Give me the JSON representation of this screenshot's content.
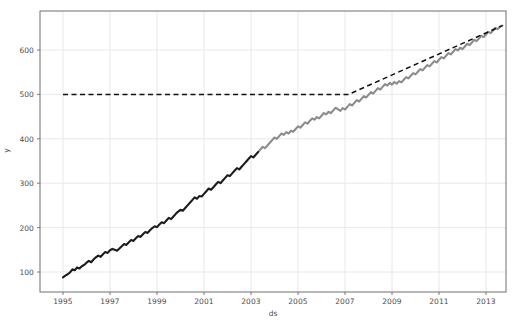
{
  "figure": {
    "title": "",
    "background_color": "#ffffff",
    "axes_background_color": "#ffffff",
    "spine_color": "#6e6e6e",
    "grid_color": "#e8e8ee",
    "plot_box": {
      "left": 40,
      "top": 11,
      "right": 506,
      "bottom": 292
    }
  },
  "axis_labels": {
    "x": "ds",
    "y": "y"
  },
  "y_ticks": [
    {
      "value": 100,
      "label": "100",
      "py": 272.0
    },
    {
      "value": 200,
      "label": "200",
      "py": 227.6
    },
    {
      "value": 300,
      "label": "300",
      "py": 183.2
    },
    {
      "value": 400,
      "label": "400",
      "py": 138.8
    },
    {
      "value": 500,
      "label": "500",
      "py": 94.4
    },
    {
      "value": 600,
      "label": "600",
      "py": 50.0
    }
  ],
  "x_ticks": [
    {
      "value": 1995,
      "label": "1995",
      "px": 63.0
    },
    {
      "value": 1997,
      "label": "1997",
      "px": 112.5
    },
    {
      "value": 1999,
      "label": "1999",
      "px": 162.0
    },
    {
      "value": 2001,
      "label": "2001",
      "px": 211.5
    },
    {
      "value": 2003,
      "label": "2003",
      "px": 261.0
    },
    {
      "value": 2005,
      "label": "2005",
      "px": 310.5
    },
    {
      "value": 2009,
      "label": "2009",
      "px": 409.5
    },
    {
      "value": 2007,
      "label": "2007",
      "px": 360.0
    },
    {
      "value": 2011,
      "label": "2011",
      "px": 459.0
    },
    {
      "value": 2013,
      "label": "2013",
      "px": 486.0
    }
  ],
  "colors": {
    "series_early": "#1c1c1c",
    "series_late": "#8c8c8c",
    "trend": "#111111",
    "grid": "#e8e8ee",
    "spine": "#6e6e6e"
  },
  "chart_data": {
    "type": "line",
    "title": "",
    "xlabel": "ds",
    "ylabel": "y",
    "xlim": [
      1994.3,
      1994.3
    ],
    "ylim": [
      60,
      690
    ],
    "grid": true,
    "legend": "none",
    "x_tick_labels": [
      "1995",
      "1997",
      "1999",
      "2001",
      "2003",
      "2005",
      "2007",
      "2009",
      "2011",
      "2013"
    ],
    "y_tick_labels": [
      "100",
      "200",
      "300",
      "400",
      "500",
      "600"
    ],
    "x_axis_range": [
      1994.3,
      1994.3
    ],
    "y_axis_range": [
      60,
      690
    ],
    "series": [
      {
        "name": "y",
        "style": "solid-noisy",
        "note": "observed series; darker early (1995-2003), lighter gray later (2003-2013.7)",
        "color_early": "#1c1c1c",
        "color_late": "#8c8c8c",
        "x": [
          1995.0,
          1995.1,
          1995.2,
          1995.3,
          1995.4,
          1995.5,
          1995.6,
          1995.7,
          1995.8,
          1995.9,
          1996.0,
          1996.1,
          1996.2,
          1996.3,
          1996.4,
          1996.5,
          1996.6,
          1996.7,
          1996.8,
          1996.9,
          1997.0,
          1997.1,
          1997.2,
          1997.3,
          1997.4,
          1997.5,
          1997.6,
          1997.7,
          1997.8,
          1997.9,
          1998.0,
          1998.1,
          1998.2,
          1998.3,
          1998.4,
          1998.5,
          1998.6,
          1998.7,
          1998.8,
          1998.9,
          1999.0,
          1999.1,
          1999.2,
          1999.3,
          1999.4,
          1999.5,
          1999.6,
          1999.7,
          1999.8,
          1999.9,
          2000.0,
          2000.1,
          2000.2,
          2000.3,
          2000.4,
          2000.5,
          2000.6,
          2000.7,
          2000.8,
          2000.9,
          2001.0,
          2001.1,
          2001.2,
          2001.3,
          2001.4,
          2001.5,
          2001.6,
          2001.7,
          2001.8,
          2001.9,
          2002.0,
          2002.1,
          2002.2,
          2002.3,
          2002.4,
          2002.5,
          2002.6,
          2002.7,
          2002.8,
          2002.9,
          2003.0,
          2003.1,
          2003.2,
          2003.3,
          2003.4,
          2003.5,
          2003.6,
          2003.7,
          2003.8,
          2003.9,
          2004.0,
          2004.1,
          2004.2,
          2004.3,
          2004.4,
          2004.5,
          2004.6,
          2004.7,
          2004.8,
          2004.9,
          2005.0,
          2005.1,
          2005.2,
          2005.3,
          2005.4,
          2005.5,
          2005.6,
          2005.7,
          2005.8,
          2005.9,
          2006.0,
          2006.1,
          2006.2,
          2006.3,
          2006.4,
          2006.5,
          2006.6,
          2006.7,
          2006.8,
          2006.9,
          2007.0,
          2007.1,
          2007.2,
          2007.3,
          2007.4,
          2007.5,
          2007.6,
          2007.7,
          2007.8,
          2007.9,
          2008.0,
          2008.1,
          2008.2,
          2008.3,
          2008.4,
          2008.5,
          2008.6,
          2008.7,
          2008.8,
          2008.9,
          2009.0,
          2009.1,
          2009.2,
          2009.3,
          2009.4,
          2009.5,
          2009.6,
          2009.7,
          2009.8,
          2009.9,
          2010.0,
          2010.1,
          2010.2,
          2010.3,
          2010.4,
          2010.5,
          2010.6,
          2010.7,
          2010.8,
          2010.9,
          2011.0,
          2011.1,
          2011.2,
          2011.3,
          2011.4,
          2011.5,
          2011.6,
          2011.7,
          2011.8,
          2011.9,
          2012.0,
          2012.1,
          2012.2,
          2012.3,
          2012.4,
          2012.5,
          2012.6,
          2012.7,
          2012.8,
          2012.9,
          2013.0,
          2013.1,
          2013.2,
          2013.3,
          2013.4,
          2013.5,
          2013.6,
          2013.7
        ],
        "y": [
          88,
          92,
          95,
          99,
          106,
          104,
          110,
          108,
          113,
          116,
          121,
          125,
          122,
          128,
          133,
          137,
          134,
          140,
          145,
          143,
          149,
          152,
          150,
          148,
          153,
          158,
          163,
          161,
          167,
          172,
          170,
          176,
          181,
          179,
          185,
          190,
          188,
          194,
          199,
          203,
          201,
          207,
          212,
          210,
          216,
          222,
          219,
          225,
          231,
          236,
          240,
          238,
          244,
          250,
          256,
          262,
          268,
          265,
          271,
          270,
          276,
          282,
          288,
          285,
          291,
          297,
          303,
          300,
          306,
          312,
          318,
          316,
          322,
          328,
          334,
          331,
          337,
          343,
          349,
          355,
          361,
          358,
          364,
          370,
          376,
          382,
          379,
          385,
          391,
          397,
          403,
          400,
          406,
          412,
          409,
          415,
          412,
          418,
          416,
          422,
          428,
          425,
          431,
          437,
          434,
          440,
          446,
          443,
          449,
          446,
          452,
          458,
          455,
          461,
          458,
          464,
          470,
          467,
          463,
          469,
          466,
          472,
          478,
          475,
          481,
          487,
          484,
          490,
          496,
          493,
          499,
          505,
          502,
          508,
          514,
          511,
          517,
          523,
          520,
          526,
          522,
          528,
          524,
          530,
          527,
          533,
          539,
          536,
          542,
          548,
          545,
          551,
          557,
          554,
          560,
          566,
          563,
          569,
          575,
          572,
          578,
          584,
          581,
          587,
          593,
          590,
          596,
          602,
          599,
          605,
          602,
          608,
          614,
          611,
          617,
          623,
          620,
          626,
          632,
          629,
          635,
          641,
          638,
          644,
          650,
          647,
          653,
          655
        ]
      },
      {
        "name": "trend",
        "style": "dashed",
        "color": "#111111",
        "note": "flat at 500 until 2007.15, then linear rise to 655 at 2013.7",
        "x": [
          1995.0,
          2007.15,
          2013.7
        ],
        "y": [
          500,
          500,
          655
        ]
      }
    ]
  }
}
